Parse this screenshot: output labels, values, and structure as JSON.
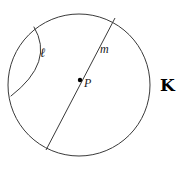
{
  "diagram": {
    "background_color": "#ffffff",
    "stroke_color": "#3a3a3a",
    "point_color": "#000000",
    "canvas": {
      "width": 183,
      "height": 169
    },
    "circle": {
      "name": "circle-k",
      "center_x": 79,
      "center_y": 85,
      "radius": 71,
      "stroke_width": 1
    },
    "center_point": {
      "name": "point-p",
      "x": 80,
      "y": 80,
      "radius": 2.2
    },
    "diameter_line": {
      "name": "line-m",
      "x1": 115,
      "y1": 18,
      "x2": 46,
      "y2": 150,
      "stroke_width": 1
    },
    "arc": {
      "name": "arc-ell",
      "start_x": 34,
      "start_y": 27,
      "end_x": 11,
      "end_y": 96,
      "control_x": 55,
      "control_y": 62,
      "stroke_width": 1
    },
    "labels": {
      "arc_label": "ℓ",
      "line_label": "m",
      "point_label": "P",
      "circle_label": "K"
    }
  }
}
